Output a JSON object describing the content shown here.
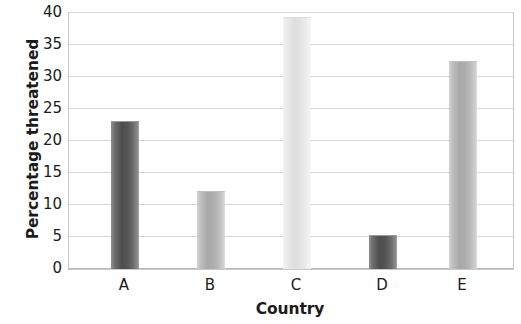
{
  "chart_data": {
    "type": "bar",
    "title": "",
    "subtitle": "",
    "xlabel": "Country",
    "ylabel": "Percentage threatened",
    "categories": [
      "A",
      "B",
      "C",
      "D",
      "E"
    ],
    "values": [
      23.1,
      12.2,
      39.4,
      5.3,
      32.5
    ],
    "ylim": [
      0,
      40
    ],
    "ytick_labels": [
      "0",
      "5",
      "10",
      "15",
      "20",
      "25",
      "30",
      "35",
      "40"
    ],
    "ytick_values": [
      0,
      5,
      10,
      15,
      20,
      25,
      30,
      35,
      40
    ],
    "grid": true,
    "grid_axis": "y",
    "legend": false,
    "legend_position": "none",
    "bar_styles": [
      "dark",
      "medium",
      "light",
      "dark",
      "medium"
    ],
    "colors": {
      "bar_dark": "#4e4e4e",
      "bar_medium": "#a8a8a8",
      "bar_light": "#dedede",
      "gridline": "#d6d6d6",
      "axis": "#b9b9b9",
      "text": "#1b1b1b",
      "background": "#ffffff"
    },
    "annotations": []
  }
}
